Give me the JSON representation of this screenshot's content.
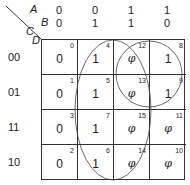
{
  "variables": {
    "a": "A",
    "b": "B",
    "c": "C",
    "d": "D"
  },
  "column_headers": [
    {
      "a": "0",
      "b": "0"
    },
    {
      "a": "0",
      "b": "1"
    },
    {
      "a": "1",
      "b": "1"
    },
    {
      "a": "1",
      "b": "0"
    }
  ],
  "row_headers": [
    "00",
    "01",
    "11",
    "10"
  ],
  "cells": [
    [
      {
        "index": "0",
        "value": "0"
      },
      {
        "index": "4",
        "value": "1"
      },
      {
        "index": "12",
        "value": "φ"
      },
      {
        "index": "8",
        "value": "1"
      }
    ],
    [
      {
        "index": "1",
        "value": "0"
      },
      {
        "index": "5",
        "value": "1"
      },
      {
        "index": "13",
        "value": "φ"
      },
      {
        "index": "9",
        "value": "1"
      }
    ],
    [
      {
        "index": "3",
        "value": "0"
      },
      {
        "index": "7",
        "value": "1"
      },
      {
        "index": "15",
        "value": "φ"
      },
      {
        "index": "11",
        "value": "φ"
      }
    ],
    [
      {
        "index": "2",
        "value": "0"
      },
      {
        "index": "6",
        "value": "1"
      },
      {
        "index": "14",
        "value": "φ"
      },
      {
        "index": "10",
        "value": "φ"
      }
    ]
  ],
  "groupings": [
    {
      "name": "B",
      "cells": [
        "4",
        "5",
        "7",
        "6",
        "12",
        "13",
        "15",
        "14"
      ]
    },
    {
      "name": "AC'",
      "cells": [
        "12",
        "8",
        "13",
        "9"
      ]
    }
  ]
}
